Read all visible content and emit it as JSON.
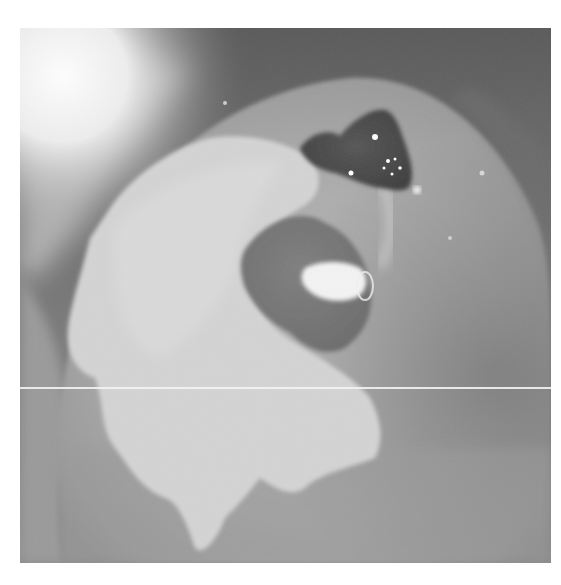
{
  "image": {
    "kind": "grayscale clinical photograph",
    "frame": {
      "x": 20,
      "y": 28,
      "width": 531,
      "height": 535,
      "background": "#ffffff"
    },
    "colors": {
      "background_dark": "#5a5a5a",
      "tissue_mid": "#9c9c9c",
      "tissue_light": "#c8c8c8",
      "white_patch": "#d6d6d6",
      "lesion_dark": "#4a4a4a",
      "lesion_mid": "#7a7a7a",
      "highlight": "#ffffff",
      "scanline": "#f3f3f3"
    },
    "artifacts": {
      "horizontal_line_y": 387
    }
  }
}
